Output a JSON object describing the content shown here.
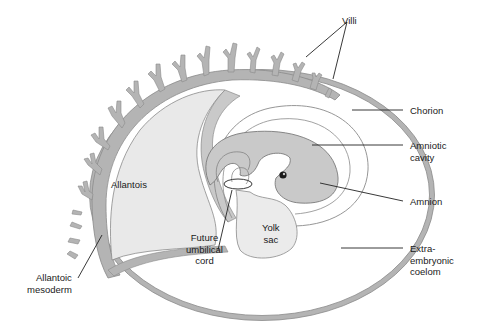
{
  "labels": {
    "villi": "Villi",
    "chorion": "Chorion",
    "amniotic_cavity": "Amniotic\ncavity",
    "amnion": "Amnion",
    "extraembryonic_coelom": "Extra-\nembryonic\ncoelom",
    "allantois": "Allantois",
    "yolk_sac": "Yolk\nsac",
    "future_umbilical_cord": "Future\numbilical\ncord",
    "allantoic_mesoderm": "Allantoic\nmesoderm"
  },
  "colors": {
    "chorion_fill": "#b4b4b4",
    "allantois_fill": "#e9e9e9",
    "embryo_fill": "#c9c9c9",
    "yolk_fill": "#ebebeb",
    "outline": "#7a7a7a",
    "leader": "#222222"
  }
}
